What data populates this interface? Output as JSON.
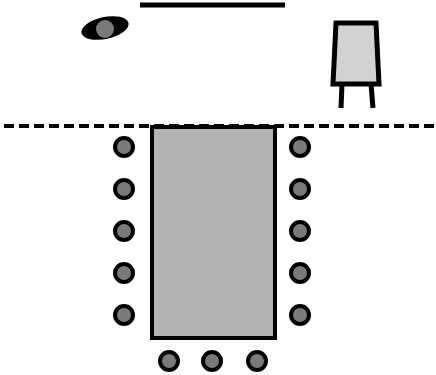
{
  "canvas": {
    "width": 436,
    "height": 375,
    "background": "#ffffff"
  },
  "colors": {
    "stroke": "#000000",
    "table_fill": "#b2b2b2",
    "chair_fill": "#7a7a7a",
    "head_fill": "#7a7a7a",
    "easel_fill": "#d2d2d2"
  },
  "screen": {
    "x1": 140,
    "y1": 5,
    "x2": 285,
    "y2": 5,
    "thickness": 5
  },
  "presenter": {
    "body": {
      "cx": 105,
      "cy": 28,
      "rx": 24,
      "ry": 11,
      "rotate": -12
    },
    "head": {
      "cx": 105,
      "cy": 29,
      "r": 9
    }
  },
  "easel": {
    "board": {
      "points": "336,23 376,23 379,84 333,84"
    },
    "legs": [
      {
        "x1": 342,
        "y1": 84,
        "x2": 341,
        "y2": 108
      },
      {
        "x1": 371,
        "y1": 84,
        "x2": 373,
        "y2": 108
      }
    ]
  },
  "divider": {
    "x1": 4,
    "y1": 126,
    "x2": 436,
    "y2": 126,
    "dash": "10 5",
    "thickness": 4
  },
  "table": {
    "x": 152,
    "y": 127,
    "width": 123,
    "height": 211,
    "stroke_width": 4
  },
  "chairs": {
    "radius": 9,
    "stroke_width": 4,
    "left": [
      {
        "cx": 124,
        "cy": 147
      },
      {
        "cx": 124,
        "cy": 189
      },
      {
        "cx": 124,
        "cy": 231
      },
      {
        "cx": 124,
        "cy": 273
      },
      {
        "cx": 124,
        "cy": 315
      }
    ],
    "right": [
      {
        "cx": 300,
        "cy": 147
      },
      {
        "cx": 300,
        "cy": 189
      },
      {
        "cx": 300,
        "cy": 231
      },
      {
        "cx": 300,
        "cy": 273
      },
      {
        "cx": 300,
        "cy": 315
      }
    ],
    "bottom": [
      {
        "cx": 169,
        "cy": 361
      },
      {
        "cx": 212,
        "cy": 361
      },
      {
        "cx": 257,
        "cy": 361
      }
    ]
  }
}
